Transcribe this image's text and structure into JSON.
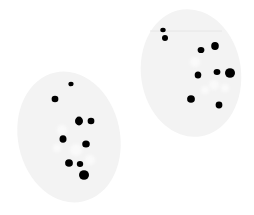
{
  "image": {
    "width": 254,
    "height": 215,
    "background": "#ffffff",
    "caption": "Two egg-shaped cells with dark spots"
  },
  "colors": {
    "cell_fill": "#f3f3f3",
    "cell_highlight": "#fafafa",
    "spot": "#050505",
    "faint_line": "#e6e6e6"
  },
  "cells": [
    {
      "id": "left-cell",
      "cx": 69,
      "cy": 137,
      "rx": 51,
      "ry": 66,
      "rotate": -12,
      "highlights": [
        {
          "cx": 62,
          "cy": 130,
          "r": 5
        },
        {
          "cx": 76,
          "cy": 150,
          "r": 6
        },
        {
          "cx": 90,
          "cy": 160,
          "r": 5
        },
        {
          "cx": 57,
          "cy": 148,
          "r": 4
        }
      ],
      "spots": [
        {
          "cx": 71,
          "cy": 84,
          "rx": 2.6,
          "ry": 2.3
        },
        {
          "cx": 55,
          "cy": 99,
          "rx": 3.4,
          "ry": 3.2
        },
        {
          "cx": 79,
          "cy": 121,
          "rx": 4.0,
          "ry": 4.4
        },
        {
          "cx": 91,
          "cy": 121,
          "rx": 3.4,
          "ry": 3.2
        },
        {
          "cx": 63,
          "cy": 139,
          "rx": 3.5,
          "ry": 3.8
        },
        {
          "cx": 86,
          "cy": 144,
          "rx": 3.8,
          "ry": 3.6
        },
        {
          "cx": 69,
          "cy": 163,
          "rx": 3.9,
          "ry": 3.8
        },
        {
          "cx": 80,
          "cy": 164,
          "rx": 3.2,
          "ry": 3.0
        },
        {
          "cx": 84,
          "cy": 175,
          "rx": 5.0,
          "ry": 4.8
        }
      ]
    },
    {
      "id": "right-cell",
      "cx": 191,
      "cy": 73,
      "rx": 50,
      "ry": 64,
      "rotate": -8,
      "highlights": [
        {
          "cx": 195,
          "cy": 62,
          "r": 5
        },
        {
          "cx": 214,
          "cy": 85,
          "r": 5
        },
        {
          "cx": 205,
          "cy": 90,
          "r": 4
        },
        {
          "cx": 225,
          "cy": 88,
          "r": 4
        }
      ],
      "faint_line": {
        "x1": 150,
        "y1": 31,
        "x2": 222,
        "y2": 31
      },
      "spots": [
        {
          "cx": 163,
          "cy": 30,
          "rx": 2.7,
          "ry": 2.2
        },
        {
          "cx": 165,
          "cy": 38,
          "rx": 3.0,
          "ry": 2.9
        },
        {
          "cx": 201,
          "cy": 50,
          "rx": 3.4,
          "ry": 3.1
        },
        {
          "cx": 215,
          "cy": 46,
          "rx": 3.8,
          "ry": 4.0
        },
        {
          "cx": 198,
          "cy": 75,
          "rx": 3.3,
          "ry": 3.6
        },
        {
          "cx": 217,
          "cy": 72,
          "rx": 3.4,
          "ry": 3.0
        },
        {
          "cx": 230,
          "cy": 73,
          "rx": 5.0,
          "ry": 4.8
        },
        {
          "cx": 191,
          "cy": 99,
          "rx": 3.9,
          "ry": 3.8
        },
        {
          "cx": 219,
          "cy": 105,
          "rx": 3.4,
          "ry": 3.4
        }
      ]
    }
  ]
}
